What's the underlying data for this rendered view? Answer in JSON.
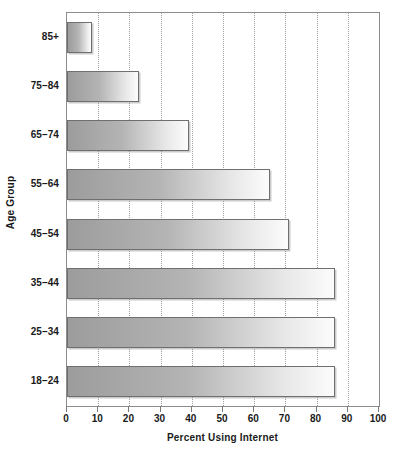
{
  "chart_data": {
    "type": "bar",
    "orientation": "horizontal",
    "title": "",
    "xlabel": "Percent Using Internet",
    "ylabel": "Age Group",
    "categories": [
      "18–24",
      "25–34",
      "35–44",
      "45–54",
      "55–64",
      "65–74",
      "75–84",
      "85+"
    ],
    "values": [
      86,
      86,
      86,
      71,
      65,
      39,
      23,
      8
    ],
    "xlim": [
      0,
      100
    ],
    "xticks": [
      0,
      10,
      20,
      30,
      40,
      50,
      60,
      70,
      80,
      90,
      100
    ],
    "xtick_labels": [
      "0",
      "10",
      "20",
      "30",
      "40",
      "50",
      "60",
      "70",
      "80",
      "90",
      "100"
    ],
    "grid": true,
    "grid_axis": "x",
    "grid_style": "dotted",
    "legend": false,
    "legend_position": "none",
    "bar_fill": "linear-gradient-gray",
    "bar_color_start": "#9c9c9c",
    "bar_color_end": "#fcfcfc",
    "bar_border_color": "#6f6f6f",
    "grid_color": "#9e9e9e",
    "axis_color": "#8c8c8c",
    "text_color": "#1a1a1a",
    "background": "#ffffff",
    "rows_top_to_bottom": [
      {
        "category": "85+",
        "value": 8
      },
      {
        "category": "75–84",
        "value": 23
      },
      {
        "category": "65–74",
        "value": 39
      },
      {
        "category": "55–64",
        "value": 65
      },
      {
        "category": "45–54",
        "value": 71
      },
      {
        "category": "35–44",
        "value": 86
      },
      {
        "category": "25–34",
        "value": 86
      },
      {
        "category": "18–24",
        "value": 86
      }
    ]
  }
}
